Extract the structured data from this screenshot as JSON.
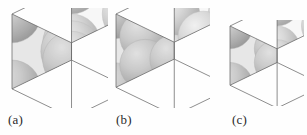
{
  "figure": {
    "background_color": "#fefefe",
    "label_color": "#2a2a2a",
    "panel_count": 3
  },
  "palette": {
    "sphere_light": "#f2f2f2",
    "sphere_mid": "#c9c9c9",
    "sphere_dark": "#8e8e8e",
    "sphere_shadow": "#6f6f6f",
    "face_top": "#eeeeee",
    "face_left": "#c4c4c4",
    "face_right": "#d6d6d6",
    "edge_line": "#6a6a6a",
    "interstice": "#ffffff"
  },
  "panels": [
    {
      "id": "panel-a",
      "label": "(a)",
      "x": 6,
      "y": 8,
      "width": 102,
      "height": 100,
      "cube_size": 96,
      "packing": "dense-large-spheres",
      "sphere_scale": 1.0,
      "description": "Cube with large close-packed spheres, corners and faces occupied",
      "spheres": [
        {
          "cx": 0.0,
          "cy": 0.0,
          "cz": 0.0,
          "r": 0.3,
          "depth": 0
        },
        {
          "cx": 1.0,
          "cy": 0.0,
          "cz": 0.0,
          "r": 0.3,
          "depth": 1
        },
        {
          "cx": 0.0,
          "cy": 1.0,
          "cz": 0.0,
          "r": 0.3,
          "depth": 2
        },
        {
          "cx": 1.0,
          "cy": 1.0,
          "cz": 0.0,
          "r": 0.3,
          "depth": 3
        },
        {
          "cx": 0.0,
          "cy": 0.0,
          "cz": 1.0,
          "r": 0.3,
          "depth": 4
        },
        {
          "cx": 1.0,
          "cy": 0.0,
          "cz": 1.0,
          "r": 0.3,
          "depth": 5
        },
        {
          "cx": 0.0,
          "cy": 1.0,
          "cz": 1.0,
          "r": 0.3,
          "depth": 6
        },
        {
          "cx": 1.0,
          "cy": 1.0,
          "cz": 1.0,
          "r": 0.3,
          "depth": 7
        },
        {
          "cx": 0.5,
          "cy": 0.5,
          "cz": 0.5,
          "r": 0.32,
          "depth": 8
        }
      ]
    },
    {
      "id": "panel-b",
      "label": "(b)",
      "x": 110,
      "y": 8,
      "width": 100,
      "height": 100,
      "cube_size": 94,
      "packing": "medium-spheres-more-numerous",
      "sphere_scale": 0.86,
      "description": "Cube with a greater number of medium spheres and visible interstitial voids",
      "spheres": [
        {
          "cx": 0.0,
          "cy": 0.0,
          "cz": 0.0,
          "r": 0.26,
          "depth": 0
        },
        {
          "cx": 1.0,
          "cy": 0.0,
          "cz": 0.0,
          "r": 0.26,
          "depth": 1
        },
        {
          "cx": 0.0,
          "cy": 1.0,
          "cz": 0.0,
          "r": 0.26,
          "depth": 2
        },
        {
          "cx": 1.0,
          "cy": 1.0,
          "cz": 0.0,
          "r": 0.26,
          "depth": 3
        },
        {
          "cx": 0.0,
          "cy": 0.0,
          "cz": 1.0,
          "r": 0.26,
          "depth": 4
        },
        {
          "cx": 1.0,
          "cy": 0.0,
          "cz": 1.0,
          "r": 0.26,
          "depth": 5
        },
        {
          "cx": 0.0,
          "cy": 1.0,
          "cz": 1.0,
          "r": 0.26,
          "depth": 6
        },
        {
          "cx": 1.0,
          "cy": 1.0,
          "cz": 1.0,
          "r": 0.26,
          "depth": 7
        },
        {
          "cx": 0.5,
          "cy": 0.5,
          "cz": 0.0,
          "r": 0.27,
          "depth": 8
        },
        {
          "cx": 0.5,
          "cy": 0.5,
          "cz": 1.0,
          "r": 0.27,
          "depth": 9
        },
        {
          "cx": 0.5,
          "cy": 0.0,
          "cz": 0.5,
          "r": 0.27,
          "depth": 10
        },
        {
          "cx": 0.5,
          "cy": 1.0,
          "cz": 0.5,
          "r": 0.27,
          "depth": 11
        },
        {
          "cx": 0.0,
          "cy": 0.5,
          "cz": 0.5,
          "r": 0.27,
          "depth": 12
        },
        {
          "cx": 1.0,
          "cy": 0.5,
          "cz": 0.5,
          "r": 0.27,
          "depth": 13
        }
      ]
    },
    {
      "id": "panel-c",
      "label": "(c)",
      "x": 224,
      "y": 20,
      "width": 80,
      "height": 86,
      "cube_size": 76,
      "packing": "simple-cubic-corner-spheres",
      "sphere_scale": 0.72,
      "description": "Smaller cube, spheres only at the eight corners leaving an open central cavity",
      "spheres": [
        {
          "cx": 0.0,
          "cy": 0.0,
          "cz": 0.0,
          "r": 0.3,
          "depth": 0
        },
        {
          "cx": 1.0,
          "cy": 0.0,
          "cz": 0.0,
          "r": 0.3,
          "depth": 1
        },
        {
          "cx": 0.0,
          "cy": 1.0,
          "cz": 0.0,
          "r": 0.3,
          "depth": 2
        },
        {
          "cx": 1.0,
          "cy": 1.0,
          "cz": 0.0,
          "r": 0.3,
          "depth": 3
        },
        {
          "cx": 0.0,
          "cy": 0.0,
          "cz": 1.0,
          "r": 0.3,
          "depth": 4
        },
        {
          "cx": 1.0,
          "cy": 0.0,
          "cz": 1.0,
          "r": 0.3,
          "depth": 5
        },
        {
          "cx": 0.0,
          "cy": 1.0,
          "cz": 1.0,
          "r": 0.3,
          "depth": 6
        },
        {
          "cx": 1.0,
          "cy": 1.0,
          "cz": 1.0,
          "r": 0.3,
          "depth": 7
        }
      ]
    }
  ],
  "labels": [
    {
      "id": "label-a",
      "text": "(a)",
      "x": 8,
      "y": 112
    },
    {
      "id": "label-b",
      "text": "(b)",
      "x": 116,
      "y": 112
    },
    {
      "id": "label-c",
      "text": "(c)",
      "x": 232,
      "y": 112
    }
  ]
}
